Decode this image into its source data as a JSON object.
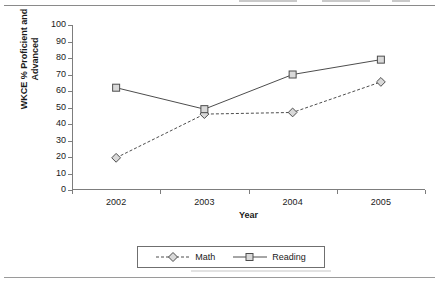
{
  "chart_data": {
    "type": "line",
    "title": "",
    "subtitle": "",
    "xlabel": "Year",
    "ylabel": "WKCE % Proficient and Advanced",
    "ylabel_line1": "WKCE % Proficient and",
    "ylabel_line2": "Advanced",
    "categories": [
      "2002",
      "2003",
      "2004",
      "2005"
    ],
    "x": [
      2002,
      2003,
      2004,
      2005
    ],
    "ylim": [
      0,
      100
    ],
    "ytick_step": 10,
    "yticks": [
      0,
      10,
      20,
      30,
      40,
      50,
      60,
      70,
      80,
      90,
      100
    ],
    "grid": false,
    "legend_position": "bottom-center",
    "series": [
      {
        "name": "Math",
        "values": [
          19.5,
          46,
          47,
          65.5
        ],
        "line_style": "dashed",
        "marker": "diamond",
        "color": "#4d4d4d"
      },
      {
        "name": "Reading",
        "values": [
          62,
          49,
          70,
          79
        ],
        "line_style": "solid",
        "marker": "square",
        "color": "#4d4d4d"
      }
    ]
  },
  "axes": {
    "y_title_line1": "WKCE % Proficient and",
    "y_title_line2": "Advanced",
    "x_title": "Year",
    "y_tick_labels": [
      "100",
      "90",
      "80",
      "70",
      "60",
      "50",
      "40",
      "30",
      "20",
      "10",
      "0"
    ],
    "x_tick_labels": [
      "2002",
      "2003",
      "2004",
      "2005"
    ]
  },
  "legend": {
    "items": [
      {
        "label": "Math"
      },
      {
        "label": "Reading"
      }
    ]
  },
  "colors": {
    "axis": "#7d7d7d",
    "series_math": "#4d4d4d",
    "series_reading": "#4d4d4d",
    "marker_fill": "#d9d9d9",
    "rule": "#8a8a8a",
    "text": "#1a1a1a"
  }
}
